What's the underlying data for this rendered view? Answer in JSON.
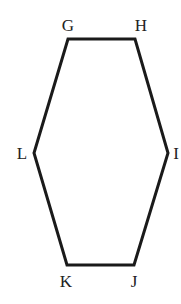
{
  "diagram": {
    "type": "hexagon",
    "stroke_color": "#1a1a1a",
    "label_color": "#222222",
    "vertices": [
      {
        "label": "G",
        "x": 68,
        "y": 39,
        "lx": 68,
        "ly": 31
      },
      {
        "label": "H",
        "x": 135,
        "y": 39,
        "lx": 141,
        "ly": 31
      },
      {
        "label": "I",
        "x": 168,
        "y": 153,
        "lx": 176,
        "ly": 159
      },
      {
        "label": "J",
        "x": 134,
        "y": 265,
        "lx": 134,
        "ly": 287
      },
      {
        "label": "K",
        "x": 67,
        "y": 265,
        "lx": 66,
        "ly": 287
      },
      {
        "label": "L",
        "x": 34,
        "y": 153,
        "lx": 22,
        "ly": 159
      }
    ]
  }
}
